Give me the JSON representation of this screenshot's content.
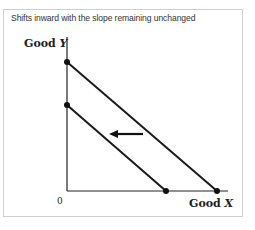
{
  "caption": "Shifts inward with the slope remaining unchanged",
  "axes": {
    "y_label_prefix": "Good ",
    "y_label_var": "Y",
    "x_label_prefix": "Good ",
    "x_label_var": "X",
    "origin": "0"
  },
  "diagram": {
    "type": "budget-line-shift",
    "lines": [
      {
        "name": "original",
        "y_intercept_px": [
          67,
          62
        ],
        "x_intercept_px": [
          217,
          191
        ]
      },
      {
        "name": "shifted",
        "y_intercept_px": [
          67,
          105
        ],
        "x_intercept_px": [
          166,
          191
        ]
      }
    ],
    "arrow": {
      "direction": "left",
      "from_px": [
        143,
        134
      ],
      "to_px": [
        110,
        134
      ]
    },
    "line_color": "#1a1a1a"
  }
}
